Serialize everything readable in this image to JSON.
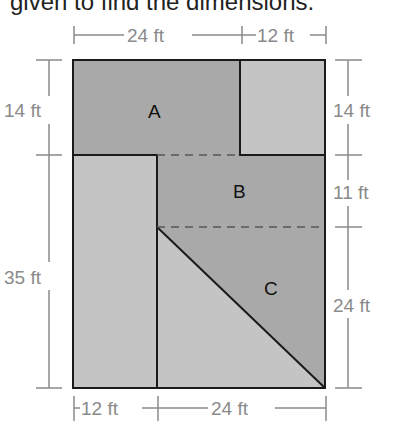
{
  "header": {
    "text": "given to find the dimensions."
  },
  "diagram": {
    "regions": [
      {
        "label": "A"
      },
      {
        "label": "B"
      },
      {
        "label": "C"
      }
    ],
    "dimensions": {
      "top": [
        "24 ft",
        "12 ft"
      ],
      "bottom": [
        "12 ft",
        "24 ft"
      ],
      "left": [
        "14 ft",
        "35 ft"
      ],
      "right": [
        "14 ft",
        "11 ft",
        "24 ft"
      ]
    },
    "colors": {
      "dark_fill": "#a9a9a9",
      "light_fill": "#c4c4c4",
      "outline": "#1a1a1a",
      "dimension": "#8a8a8a"
    }
  }
}
